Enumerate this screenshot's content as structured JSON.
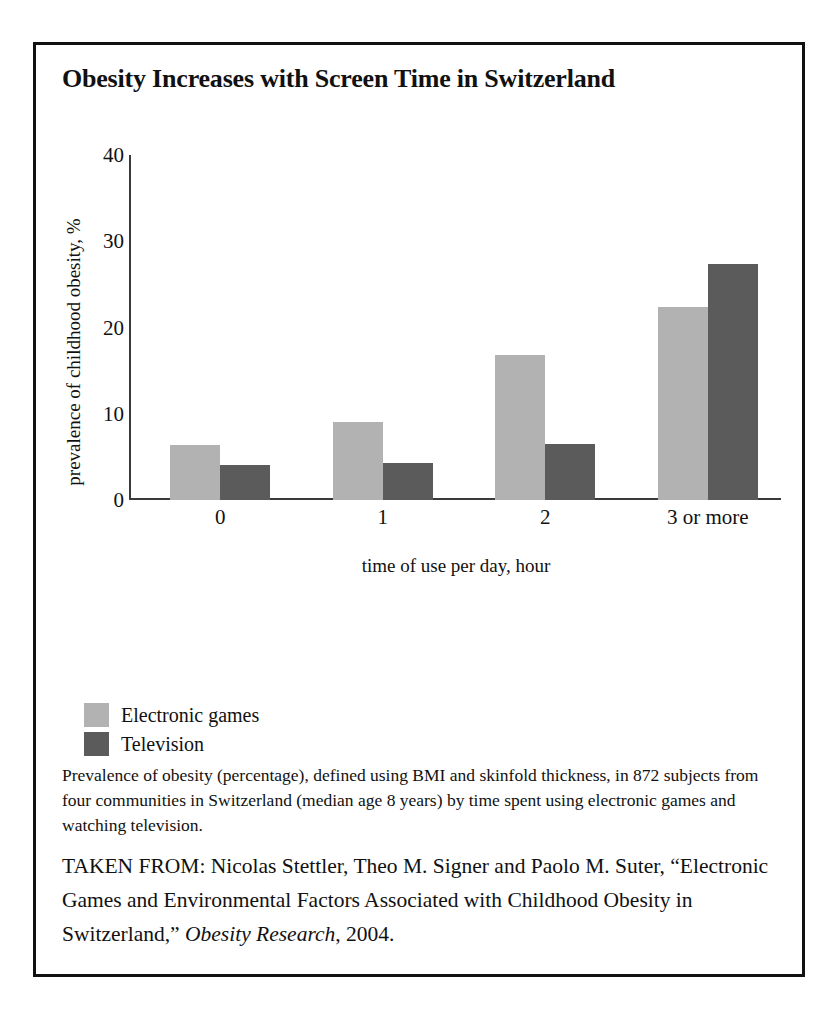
{
  "figure": {
    "title": "Obesity Increases with Screen Time in Switzerland",
    "caption": "Prevalence of obesity (percentage), defined using BMI and skinfold thickness, in 872 subjects from four communities in Switzerland (median age 8 years) by time spent using electronic games and watching television.",
    "source": {
      "prefix": "TAKEN FROM: Nicolas Stettler, Theo M. Signer and Paolo M. Suter, “Electronic Games and Environmental Factors Associated with Childhood Obesity in Switzerland,” ",
      "journal": "Obesity Research",
      "suffix": ", 2004."
    }
  },
  "colors": {
    "series_electronic_games": "#b2b2b2",
    "series_television": "#5b5b5b",
    "axis": "#3a3a3a",
    "frame": "#111111",
    "background": "#ffffff"
  },
  "chart_data": {
    "type": "bar",
    "title": "Obesity Increases with Screen Time in Switzerland",
    "xlabel": "time of use per day, hour",
    "ylabel": "prevalence of childhood obesity, %",
    "categories": [
      "0",
      "1",
      "2",
      "3 or more"
    ],
    "series": [
      {
        "name": "Electronic games",
        "color": "#b2b2b2",
        "values": [
          6.4,
          9.0,
          16.8,
          22.4
        ]
      },
      {
        "name": "Television",
        "color": "#5b5b5b",
        "values": [
          4.1,
          4.3,
          6.5,
          27.4
        ]
      }
    ],
    "ylim": [
      0,
      40
    ],
    "yticks": [
      0,
      10,
      20,
      30,
      40
    ],
    "ytick_labels": [
      "0",
      "10",
      "20",
      "30",
      "40"
    ],
    "grid": false,
    "legend_position": "below-axes-left"
  }
}
